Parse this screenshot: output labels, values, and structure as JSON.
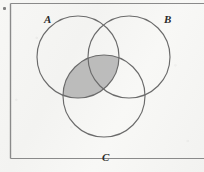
{
  "figure": {
    "kind": "venn-diagram-three-sets",
    "background_color": "#f4f4f2",
    "frame": {
      "name": "diagram-frame",
      "stroke_color": "#8a8a8a",
      "left": 10,
      "top": 3,
      "right": 190,
      "bottom": 158
    },
    "stroke_color": "#6b6b6b",
    "shade_color": "#b6b6b6",
    "circles": [
      {
        "id": "A",
        "label": "A",
        "cx": 78,
        "cy": 57,
        "r": 41
      },
      {
        "id": "B",
        "label": "B",
        "cx": 129,
        "cy": 57,
        "r": 41
      },
      {
        "id": "C",
        "label": "C",
        "cx": 104,
        "cy": 96,
        "r": 41
      }
    ],
    "labels": {
      "a": "A",
      "b": "B",
      "c": "C"
    },
    "shaded_region": {
      "name": "a-intersect-c",
      "description": "A ∩ C",
      "sets": [
        "A",
        "C"
      ]
    }
  }
}
